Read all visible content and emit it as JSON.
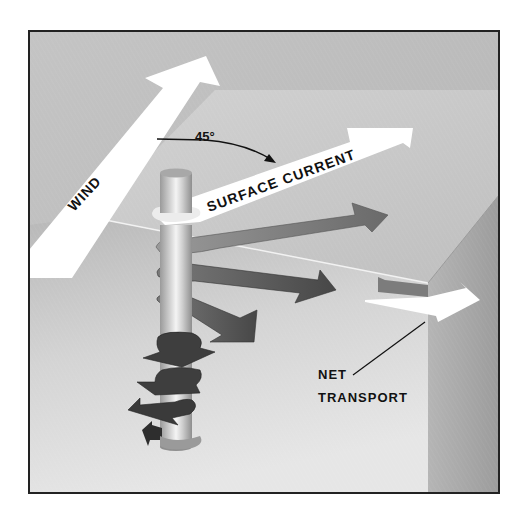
{
  "diagram": {
    "type": "Ekman spiral illustration",
    "labels": {
      "wind": "WIND",
      "angle": "45°",
      "surface_current": "SURFACE CURRENT",
      "net_transport_line1": "NET",
      "net_transport_line2": "TRANSPORT"
    },
    "colors": {
      "background": "#ffffff",
      "frame_border": "#222222",
      "sky_gray": "#bdbdbd",
      "surface_plane": "#c8c8c8",
      "water_body": "#d6d6d6",
      "right_face": "#a9a9a9",
      "white_arrow": "#ffffff",
      "current_arrow": "#6a6a6a",
      "deep_arrow": "#3e3e3e",
      "text": "#111111"
    }
  }
}
